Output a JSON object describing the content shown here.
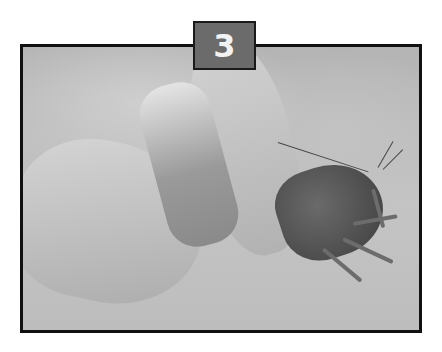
{
  "step_badge": {
    "number": "3",
    "background": "#6b6b6b",
    "text_color": "#f2f2f2"
  },
  "photo": {
    "description": "Grayscale instructional photo: hands twisting the tail off a crawfish on a light surface",
    "border_color": "#111111"
  }
}
